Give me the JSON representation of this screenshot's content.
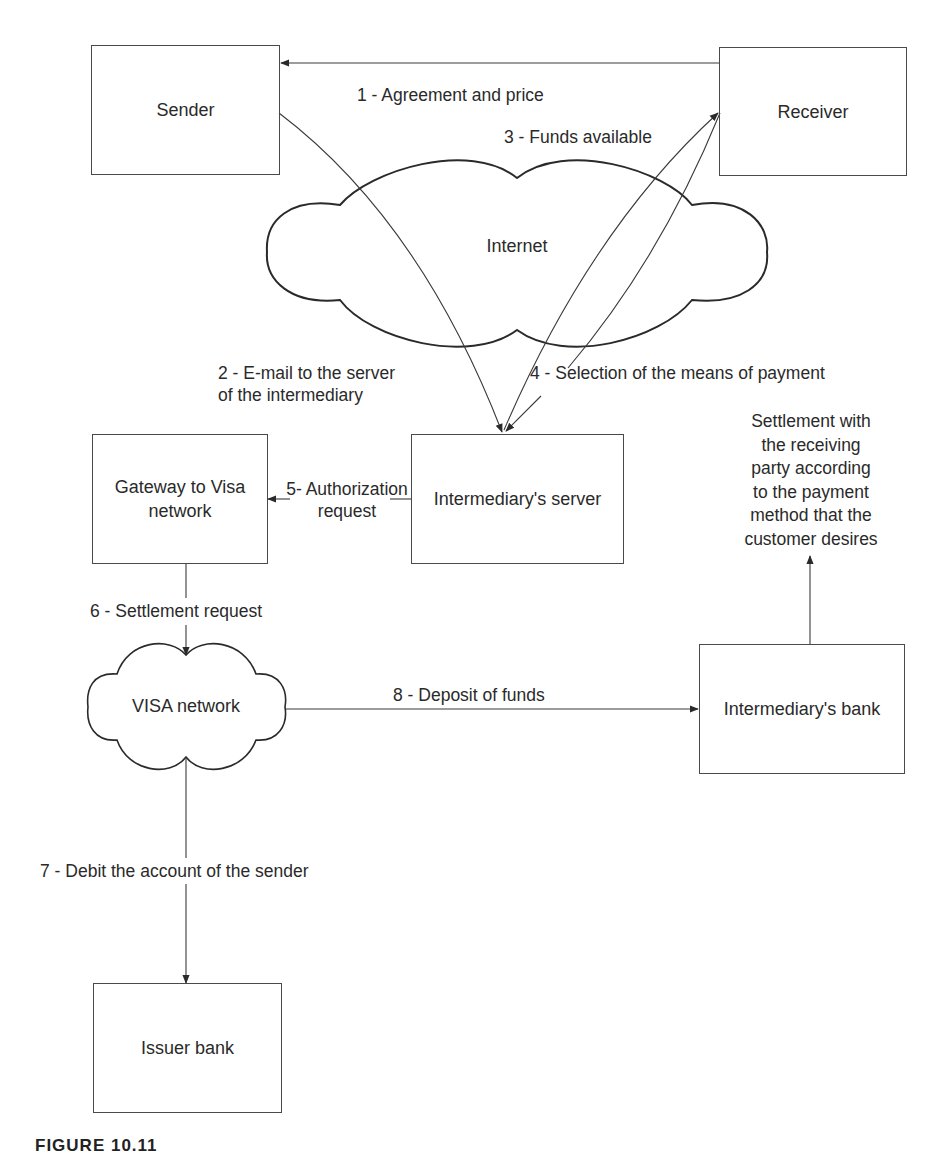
{
  "diagram": {
    "nodes": {
      "sender": "Sender",
      "receiver": "Receiver",
      "internet": "Internet",
      "gateway_line1": "Gateway to Visa",
      "gateway_line2": "network",
      "intermediary_server": "Intermediary's server",
      "visa_network": "VISA network",
      "intermediary_bank": "Intermediary's bank",
      "issuer_bank": "Issuer bank"
    },
    "edges": {
      "step1": "1 - Agreement and price",
      "step2_line1": "2 - E-mail to the server",
      "step2_line2": "of the intermediary",
      "step3": "3 - Funds available",
      "step4": "4 - Selection of the means of payment",
      "step5_line1": "5- Authorization",
      "step5_line2": "request",
      "step6": "6 - Settlement request",
      "step7": "7 - Debit the account of the sender",
      "step8": "8 - Deposit of funds"
    },
    "settlement_note": [
      "Settlement with",
      "the receiving",
      "party according",
      "to the payment",
      "method that the",
      "customer desires"
    ],
    "caption": "FIGURE 10.11"
  },
  "colors": {
    "line": "#3a3a3a",
    "text": "#2a2a2a",
    "background": "#ffffff"
  }
}
